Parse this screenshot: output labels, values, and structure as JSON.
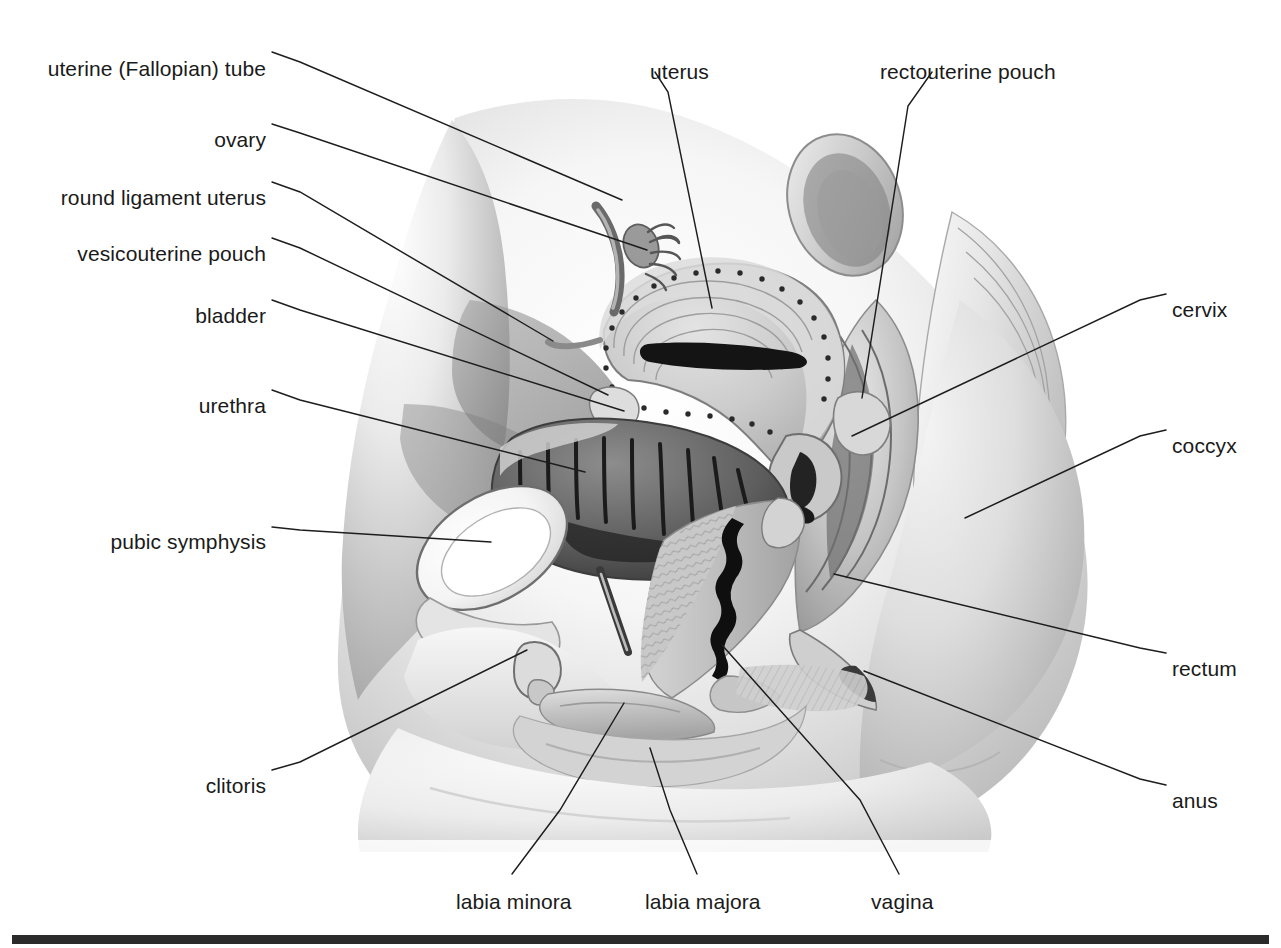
{
  "figure": {
    "background_color": "#ffffff",
    "label_color": "#1a1a1a",
    "leader_color": "#1d1d1d",
    "foot_rule_color": "#2b2b2b",
    "width": 1281,
    "height": 948
  },
  "labels": [
    {
      "id": "uterine-tube",
      "text": "uterine (Fallopian) tube",
      "x": 266,
      "y": 57,
      "align": "l",
      "leader": [
        [
          272,
          52
        ],
        [
          300,
          62
        ],
        [
          622,
          200
        ]
      ]
    },
    {
      "id": "ovary",
      "text": "ovary",
      "x": 266,
      "y": 128,
      "align": "l",
      "leader": [
        [
          272,
          124
        ],
        [
          300,
          133
        ],
        [
          647,
          250
        ]
      ]
    },
    {
      "id": "round-ligament",
      "text": "round ligament uterus",
      "x": 266,
      "y": 186,
      "align": "l",
      "leader": [
        [
          272,
          182
        ],
        [
          300,
          192
        ],
        [
          553,
          341
        ]
      ]
    },
    {
      "id": "vesicouterine-pouch",
      "text": "vesicouterine pouch",
      "x": 266,
      "y": 242,
      "align": "l",
      "leader": [
        [
          272,
          238
        ],
        [
          300,
          248
        ],
        [
          608,
          395
        ]
      ]
    },
    {
      "id": "bladder",
      "text": "bladder",
      "x": 266,
      "y": 304,
      "align": "l",
      "leader": [
        [
          272,
          300
        ],
        [
          300,
          310
        ],
        [
          624,
          411
        ]
      ]
    },
    {
      "id": "urethra",
      "text": "urethra",
      "x": 266,
      "y": 394,
      "align": "l",
      "leader": [
        [
          272,
          390
        ],
        [
          300,
          400
        ],
        [
          585,
          472
        ]
      ]
    },
    {
      "id": "pubic-symphysis",
      "text": "pubic symphysis",
      "x": 266,
      "y": 530,
      "align": "l",
      "leader": [
        [
          272,
          527
        ],
        [
          300,
          530
        ],
        [
          491,
          542
        ]
      ]
    },
    {
      "id": "clitoris",
      "text": "clitoris",
      "x": 266,
      "y": 774,
      "align": "l",
      "leader": [
        [
          272,
          770
        ],
        [
          300,
          762
        ],
        [
          527,
          650
        ]
      ]
    },
    {
      "id": "uterus",
      "text": "uterus",
      "x": 650,
      "y": 60,
      "align": "r",
      "leader": [
        [
          655,
          72
        ],
        [
          668,
          92
        ],
        [
          712,
          308
        ]
      ]
    },
    {
      "id": "rectouterine-pouch",
      "text": "rectouterine pouch",
      "x": 880,
      "y": 60,
      "align": "r",
      "leader": [
        [
          932,
          72
        ],
        [
          908,
          106
        ],
        [
          862,
          398
        ]
      ]
    },
    {
      "id": "cervix",
      "text": "cervix",
      "x": 1172,
      "y": 298,
      "align": "r",
      "leader": [
        [
          1166,
          294
        ],
        [
          1140,
          300
        ],
        [
          852,
          436
        ]
      ]
    },
    {
      "id": "coccyx",
      "text": "coccyx",
      "x": 1172,
      "y": 434,
      "align": "r",
      "leader": [
        [
          1166,
          430
        ],
        [
          1140,
          436
        ],
        [
          965,
          518
        ]
      ]
    },
    {
      "id": "rectum",
      "text": "rectum",
      "x": 1172,
      "y": 657,
      "align": "r",
      "leader": [
        [
          1166,
          653
        ],
        [
          1140,
          648
        ],
        [
          834,
          574
        ]
      ]
    },
    {
      "id": "anus",
      "text": "anus",
      "x": 1172,
      "y": 789,
      "align": "r",
      "leader": [
        [
          1166,
          785
        ],
        [
          1140,
          779
        ],
        [
          864,
          671
        ]
      ]
    },
    {
      "id": "labia-minora",
      "text": "labia minora",
      "x": 456,
      "y": 890,
      "align": "r",
      "leader": [
        [
          512,
          874
        ],
        [
          560,
          810
        ],
        [
          624,
          703
        ]
      ]
    },
    {
      "id": "labia-majora",
      "text": "labia majora",
      "x": 645,
      "y": 890,
      "align": "r",
      "leader": [
        [
          697,
          874
        ],
        [
          670,
          810
        ],
        [
          650,
          748
        ]
      ]
    },
    {
      "id": "vagina",
      "text": "vagina",
      "x": 871,
      "y": 890,
      "align": "r",
      "leader": [
        [
          899,
          874
        ],
        [
          860,
          800
        ],
        [
          722,
          645
        ]
      ]
    }
  ],
  "foot_rule": {
    "x": 12,
    "y": 935,
    "width": 1257,
    "height": 9
  },
  "structures": [
    {
      "name": "abdominal-wall",
      "shade": "#d8d8d8"
    },
    {
      "name": "uterus-body",
      "shade": "#c6c6c6"
    },
    {
      "name": "uterine-cavity",
      "shade": "#1c1c1c"
    },
    {
      "name": "bladder-lumen",
      "shade": "#3a3a3a"
    },
    {
      "name": "bladder-wall",
      "shade": "#b5b5b5"
    },
    {
      "name": "pubic-symphysis-bone",
      "shade": "#f2f2f2"
    },
    {
      "name": "vagina-canal",
      "shade": "#151515"
    },
    {
      "name": "rectum-lumen",
      "shade": "#8a8a8a"
    },
    {
      "name": "sacrum-coccyx",
      "shade": "#e4e4e4"
    },
    {
      "name": "gluteal-mass",
      "shade": "#cfcfcf"
    },
    {
      "name": "sigmoid-colon",
      "shade": "#bcbcbc"
    },
    {
      "name": "labia-majora-tissue",
      "shade": "#c2c2c2"
    },
    {
      "name": "thigh",
      "shade": "#ededed"
    }
  ]
}
